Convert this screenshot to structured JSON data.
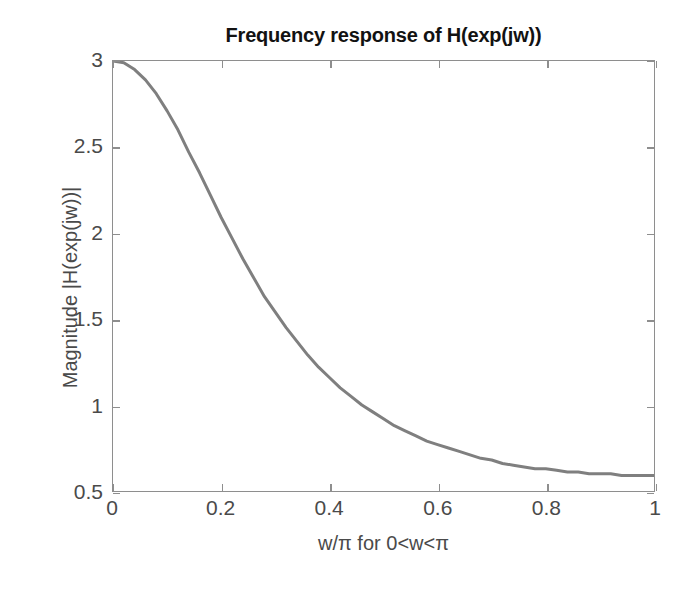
{
  "chart_data": {
    "type": "line",
    "title": "Frequency response of H(exp(jw))",
    "xlabel": "w/π for 0<w<π",
    "ylabel": "Magnitude |H(exp(jw))|",
    "xlim": [
      0,
      1
    ],
    "ylim": [
      0.5,
      3
    ],
    "xticks": [
      0,
      0.2,
      0.4,
      0.6,
      0.8,
      1
    ],
    "xticklabels": [
      "0",
      "0.2",
      "0.4",
      "0.6",
      "0.8",
      "1"
    ],
    "yticks": [
      0.5,
      1,
      1.5,
      2,
      2.5,
      3
    ],
    "yticklabels": [
      "0.5",
      "1",
      "1.5",
      "2",
      "2.5",
      "3"
    ],
    "grid": false,
    "legend": null,
    "line_color": "#7f7f7f",
    "line_width": 3,
    "series": [
      {
        "name": "|H(exp(jw))|",
        "x": [
          0.0,
          0.02,
          0.04,
          0.06,
          0.08,
          0.1,
          0.12,
          0.14,
          0.16,
          0.18,
          0.2,
          0.22,
          0.24,
          0.26,
          0.28,
          0.3,
          0.32,
          0.34,
          0.36,
          0.38,
          0.4,
          0.42,
          0.44,
          0.46,
          0.48,
          0.5,
          0.52,
          0.54,
          0.56,
          0.58,
          0.6,
          0.62,
          0.64,
          0.66,
          0.68,
          0.7,
          0.72,
          0.74,
          0.76,
          0.78,
          0.8,
          0.82,
          0.84,
          0.86,
          0.88,
          0.9,
          0.92,
          0.94,
          0.96,
          0.98,
          1.0
        ],
        "y": [
          3.0,
          2.99,
          2.95,
          2.89,
          2.81,
          2.71,
          2.6,
          2.47,
          2.35,
          2.22,
          2.09,
          1.97,
          1.85,
          1.74,
          1.63,
          1.54,
          1.45,
          1.37,
          1.29,
          1.22,
          1.16,
          1.1,
          1.05,
          1.0,
          0.96,
          0.92,
          0.88,
          0.85,
          0.82,
          0.79,
          0.77,
          0.75,
          0.73,
          0.71,
          0.69,
          0.68,
          0.66,
          0.65,
          0.64,
          0.63,
          0.63,
          0.62,
          0.61,
          0.61,
          0.6,
          0.6,
          0.6,
          0.59,
          0.59,
          0.59,
          0.59
        ]
      }
    ],
    "endpoints": {
      "start_value": 3.0,
      "end_value": 0.59
    }
  }
}
